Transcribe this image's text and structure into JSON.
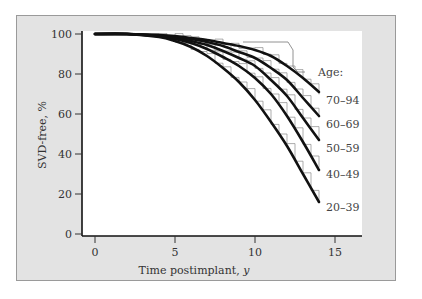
{
  "chart_data": {
    "type": "line",
    "title": "",
    "xlabel": "Time postimplant, y",
    "ylabel": "SVD-free, %",
    "xlim": [
      -1,
      18
    ],
    "ylim": [
      0,
      100
    ],
    "x_ticks": [
      0,
      5,
      10,
      15
    ],
    "y_ticks": [
      0,
      20,
      40,
      60,
      80,
      100
    ],
    "grid": false,
    "legend_title": "Age:",
    "legend_position": "right, inline at curve ends",
    "x": [
      0,
      2,
      4,
      5,
      6,
      7,
      8,
      9,
      10,
      11,
      12,
      13,
      14
    ],
    "series": [
      {
        "name": "70–94",
        "style": "fitted curve",
        "values": [
          100,
          100,
          99.5,
          99,
          98,
          97,
          95.5,
          94,
          92,
          89,
          84,
          78,
          71
        ]
      },
      {
        "name": "60–69",
        "style": "fitted curve",
        "values": [
          100,
          100,
          99,
          98.5,
          97.5,
          96,
          94,
          91,
          88,
          83,
          77,
          68,
          59
        ]
      },
      {
        "name": "50–59",
        "style": "fitted curve",
        "values": [
          100,
          100,
          99,
          98,
          96.5,
          94.5,
          91.5,
          88,
          84,
          77,
          69,
          58,
          47
        ]
      },
      {
        "name": "40–49",
        "style": "fitted curve",
        "values": [
          100,
          100,
          99,
          97.5,
          95.5,
          92.5,
          88.5,
          84,
          78,
          70,
          59,
          46,
          32
        ]
      },
      {
        "name": "20–39",
        "style": "fitted curve",
        "values": [
          100,
          100,
          98.5,
          96.5,
          93.5,
          89,
          83,
          76,
          67,
          56,
          44,
          30,
          16
        ]
      }
    ]
  },
  "axis": {
    "x_title": "Time postimplant, ",
    "x_title_unit": "y",
    "y_title": "SVD-free, %",
    "x_tick_labels": [
      "0",
      "5",
      "10",
      "15"
    ],
    "y_tick_labels": [
      "100",
      "80",
      "60",
      "40",
      "20",
      "0"
    ]
  },
  "legend": {
    "title": "Age:",
    "labels": [
      "70–94",
      "60–69",
      "50–59",
      "40–49",
      "20–39"
    ]
  },
  "colors": {
    "frame_bg": "#e3e3e3",
    "plot_bg": "#ffffff",
    "curve": "#111111",
    "step": "#8a8a8a"
  }
}
